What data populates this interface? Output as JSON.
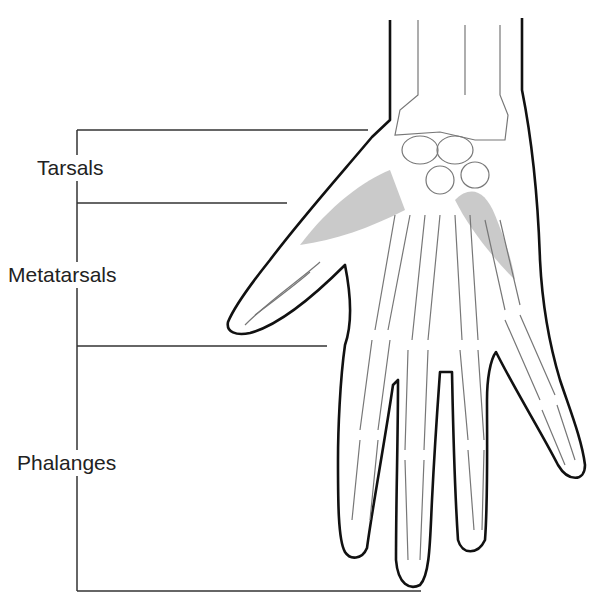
{
  "diagram": {
    "labels": [
      {
        "text": "Tarsals",
        "x": 35,
        "y": 155
      },
      {
        "text": "Metatarsals",
        "x": 8,
        "y": 262
      },
      {
        "text": "Phalanges",
        "x": 15,
        "y": 450
      }
    ],
    "bracket": {
      "x": 77,
      "lines": [
        {
          "y": 130,
          "x_end": 368
        },
        {
          "y": 203,
          "x_end": 287
        },
        {
          "y": 346,
          "x_end": 327
        },
        {
          "y": 591,
          "x_end": 421
        }
      ]
    },
    "colors": {
      "outline": "#111111",
      "bone": "#777777",
      "muscle": "#9a9a9a",
      "text": "#222222"
    }
  }
}
